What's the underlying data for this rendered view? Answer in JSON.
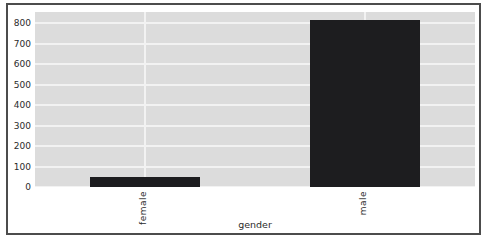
{
  "chart_data": {
    "type": "bar",
    "title": "",
    "xlabel": "gender",
    "ylabel": "",
    "categories": [
      "female",
      "male"
    ],
    "values": [
      50,
      815
    ],
    "ylim": [
      0,
      855
    ],
    "yticks": [
      0,
      100,
      200,
      300,
      400,
      500,
      600,
      700,
      800
    ],
    "grid": true,
    "legend_position": "none",
    "bar_width_fraction": 0.5,
    "colors": {
      "bar": "#1d1d1f",
      "plot_background": "#dcdcdc",
      "gridline": "#f2f2f2",
      "text": "#2b2b2b",
      "frame_border": "#4c4c4c",
      "figure_background": "#ffffff"
    }
  }
}
